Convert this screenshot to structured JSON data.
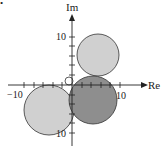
{
  "figure": {
    "marker": "•",
    "axes": {
      "x_label": "Re",
      "y_label": "Im",
      "x_tick_labels": {
        "neg": "−10",
        "pos": "10"
      },
      "y_tick_labels": {
        "pos": "10",
        "neg": "10"
      },
      "origin_px": [
        72,
        85
      ],
      "px_per_unit": 4.8
    },
    "circles": [
      {
        "name": "upper-circle",
        "center": [
          5.4,
          6.3
        ],
        "radius": 4.4,
        "fill": "#d0d0d0"
      },
      {
        "name": "center-dark-circle",
        "center": [
          4.4,
          -3.1
        ],
        "radius": 5.0,
        "fill": "#8e8e8e"
      },
      {
        "name": "lower-left-circle",
        "center": [
          -4.8,
          -5.2
        ],
        "radius": 5.2,
        "fill": "#d0d0d0"
      },
      {
        "name": "small-origin-circle",
        "center": [
          -0.6,
          0.8
        ],
        "radius": 0.8,
        "fill": "none"
      }
    ],
    "colors": {
      "light_fill": "#d0d0d0",
      "dark_fill": "#8e8e8e",
      "stroke": "#333333",
      "axis": "#222222"
    }
  }
}
